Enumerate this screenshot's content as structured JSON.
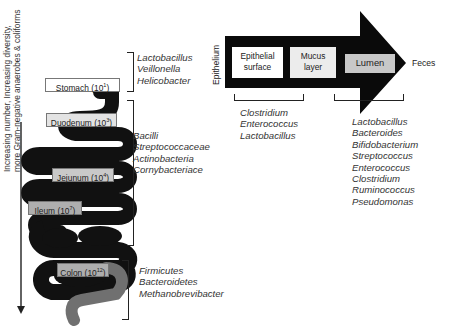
{
  "left_axis": {
    "label": "Increasing number, Increasing diversity, more Gram-negative anaerobes & coliforms"
  },
  "organs": [
    {
      "name": "Stomach",
      "base": "10",
      "exp": "1"
    },
    {
      "name": "Duodenum",
      "base": "10",
      "exp": "3"
    },
    {
      "name": "Jejunum",
      "base": "10",
      "exp": "4"
    },
    {
      "name": "Ileum",
      "base": "10",
      "exp": "7"
    },
    {
      "name": "Colon",
      "base": "10",
      "exp": "12"
    }
  ],
  "bacteria_groups": {
    "stomach": [
      "Lactobacillus",
      "Veillonella",
      "Helicobacter"
    ],
    "small_intestine": [
      "Bacilli",
      "Streptococcaceae",
      "Actinobacteria",
      "Cornybacteriace"
    ],
    "colon": [
      "Firmicutes",
      "Bacteroidetes",
      "Methanobrevibacter"
    ]
  },
  "cross_section": {
    "epithelium_label": "Epithelium",
    "zones": [
      {
        "line1": "Epithelial",
        "line2": "surface"
      },
      {
        "line1": "Mucus",
        "line2": "layer"
      },
      {
        "line1": "Lumen"
      }
    ],
    "endpoint": "Feces",
    "mucosal_bacteria": [
      "Clostridium",
      "Enterococcus",
      "Lactobacillus"
    ],
    "luminal_bacteria": [
      "Lactobacillus",
      "Bacteroides",
      "Bifidobacterium",
      "Streptococcus",
      "Enterococcus",
      "Clostridium",
      "Ruminococcus",
      "Pseudomonas"
    ]
  },
  "colors": {
    "gut_fill": "#111111",
    "colon_distal": "#6f6f6f",
    "label_gray": "#c9c9c9",
    "arrow_fill": "#0a0a0a"
  }
}
